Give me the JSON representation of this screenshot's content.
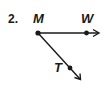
{
  "problem": {
    "number": "2."
  },
  "figure": {
    "type": "angle-with-rays",
    "vertex": "M",
    "points": [
      {
        "label": "M",
        "role": "vertex"
      },
      {
        "label": "W",
        "role": "point-on-ray"
      },
      {
        "label": "T",
        "role": "point-on-ray"
      }
    ],
    "rays": [
      {
        "from": "M",
        "through": "W",
        "direction": "right"
      },
      {
        "from": "M",
        "through": "T",
        "direction": "down-right"
      }
    ],
    "stroke_color": "#1a1a1a"
  }
}
